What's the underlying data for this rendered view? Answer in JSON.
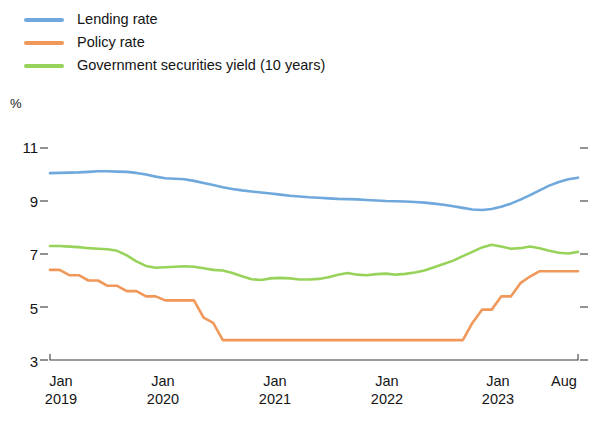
{
  "legend": {
    "items": [
      {
        "label": "Lending rate",
        "color": "#6fa8dc"
      },
      {
        "label": "Policy rate",
        "color": "#f0975a"
      },
      {
        "label": "Government securities yield (10 years)",
        "color": "#97d35a"
      }
    ]
  },
  "axes": {
    "unit_label": "%",
    "y_ticks": [
      "11",
      "9",
      "7",
      "5",
      "3"
    ],
    "x_ticks": [
      {
        "month": "Jan",
        "year": "2019"
      },
      {
        "month": "Jan",
        "year": "2020"
      },
      {
        "month": "Jan",
        "year": "2021"
      },
      {
        "month": "Jan",
        "year": "2022"
      },
      {
        "month": "Jan",
        "year": "2023"
      },
      {
        "month": "Aug",
        "year": ""
      }
    ]
  },
  "chart_data": {
    "type": "line",
    "title": "",
    "xlabel": "",
    "ylabel": "%",
    "ylim": [
      3,
      11
    ],
    "y_ticks": [
      3,
      5,
      7,
      9,
      11
    ],
    "grid": false,
    "legend_position": "top-left",
    "x_tick_labels": [
      "Jan 2019",
      "Jan 2020",
      "Jan 2021",
      "Jan 2022",
      "Jan 2023",
      "Aug"
    ],
    "x": [
      "2019-01",
      "2019-02",
      "2019-03",
      "2019-04",
      "2019-05",
      "2019-06",
      "2019-07",
      "2019-08",
      "2019-09",
      "2019-10",
      "2019-11",
      "2019-12",
      "2020-01",
      "2020-02",
      "2020-03",
      "2020-04",
      "2020-05",
      "2020-06",
      "2020-07",
      "2020-08",
      "2020-09",
      "2020-10",
      "2020-11",
      "2020-12",
      "2021-01",
      "2021-02",
      "2021-03",
      "2021-04",
      "2021-05",
      "2021-06",
      "2021-07",
      "2021-08",
      "2021-09",
      "2021-10",
      "2021-11",
      "2021-12",
      "2022-01",
      "2022-02",
      "2022-03",
      "2022-04",
      "2022-05",
      "2022-06",
      "2022-07",
      "2022-08",
      "2022-09",
      "2022-10",
      "2022-11",
      "2022-12",
      "2023-01",
      "2023-02",
      "2023-03",
      "2023-04",
      "2023-05",
      "2023-06",
      "2023-07",
      "2023-08"
    ],
    "series": [
      {
        "name": "Lending rate",
        "color": "#6fa8dc",
        "values": [
          10.05,
          10.06,
          10.07,
          10.08,
          10.1,
          10.12,
          10.12,
          10.11,
          10.1,
          10.06,
          10.0,
          9.92,
          9.86,
          9.84,
          9.82,
          9.76,
          9.68,
          9.6,
          9.52,
          9.45,
          9.4,
          9.36,
          9.32,
          9.28,
          9.24,
          9.2,
          9.17,
          9.14,
          9.12,
          9.1,
          9.08,
          9.07,
          9.06,
          9.04,
          9.02,
          9.0,
          8.99,
          8.98,
          8.96,
          8.94,
          8.9,
          8.86,
          8.8,
          8.74,
          8.68,
          8.66,
          8.7,
          8.78,
          8.9,
          9.05,
          9.22,
          9.4,
          9.58,
          9.72,
          9.82,
          9.88
        ]
      },
      {
        "name": "Policy rate",
        "color": "#f0975a",
        "values": [
          6.4,
          6.4,
          6.2,
          6.2,
          6.0,
          6.0,
          5.8,
          5.8,
          5.6,
          5.6,
          5.4,
          5.4,
          5.25,
          5.25,
          5.25,
          5.25,
          4.6,
          4.4,
          3.75,
          3.75,
          3.75,
          3.75,
          3.75,
          3.75,
          3.75,
          3.75,
          3.75,
          3.75,
          3.75,
          3.75,
          3.75,
          3.75,
          3.75,
          3.75,
          3.75,
          3.75,
          3.75,
          3.75,
          3.75,
          3.75,
          3.75,
          3.75,
          3.75,
          3.75,
          4.4,
          4.9,
          4.9,
          5.4,
          5.4,
          5.9,
          6.15,
          6.35,
          6.35,
          6.35,
          6.35,
          6.35
        ]
      },
      {
        "name": "Government securities yield (10 years)",
        "color": "#97d35a",
        "values": [
          7.3,
          7.3,
          7.28,
          7.26,
          7.22,
          7.2,
          7.18,
          7.12,
          6.95,
          6.72,
          6.55,
          6.48,
          6.5,
          6.52,
          6.54,
          6.52,
          6.46,
          6.4,
          6.38,
          6.28,
          6.16,
          6.05,
          6.02,
          6.08,
          6.1,
          6.08,
          6.04,
          6.04,
          6.06,
          6.12,
          6.22,
          6.28,
          6.22,
          6.2,
          6.24,
          6.26,
          6.22,
          6.25,
          6.3,
          6.38,
          6.5,
          6.62,
          6.75,
          6.92,
          7.08,
          7.25,
          7.35,
          7.28,
          7.2,
          7.22,
          7.28,
          7.22,
          7.12,
          7.05,
          7.02,
          7.08
        ]
      }
    ]
  }
}
